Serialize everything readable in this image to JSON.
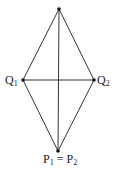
{
  "diagram": {
    "type": "geometric-rhombus",
    "line_color": "#333333",
    "point_color": "#111111",
    "points": {
      "top": {
        "x": 59,
        "y": 9,
        "label": ""
      },
      "q1": {
        "x": 23,
        "y": 80,
        "label": "Q",
        "sub": "1"
      },
      "q2": {
        "x": 94,
        "y": 80,
        "label": "Q",
        "sub": "2"
      },
      "bottom": {
        "x": 58,
        "y": 151,
        "label_left": "P",
        "sub_left": "1",
        "equals": " = ",
        "label_right": "P",
        "sub_right": "2"
      }
    },
    "edges": [
      [
        "top",
        "q1"
      ],
      [
        "top",
        "q2"
      ],
      [
        "q1",
        "bottom"
      ],
      [
        "q2",
        "bottom"
      ],
      [
        "top",
        "bottom"
      ],
      [
        "q1",
        "q2"
      ]
    ]
  }
}
